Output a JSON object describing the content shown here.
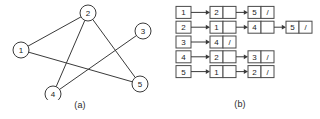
{
  "figure": {
    "panel_a": {
      "caption": "(a)",
      "nodes": [
        {
          "id": "1",
          "label": "1",
          "x": 21,
          "y": 50
        },
        {
          "id": "2",
          "label": "2",
          "x": 88,
          "y": 13
        },
        {
          "id": "3",
          "label": "3",
          "x": 143,
          "y": 31
        },
        {
          "id": "4",
          "label": "4",
          "x": 53,
          "y": 94
        },
        {
          "id": "5",
          "label": "5",
          "x": 140,
          "y": 84
        }
      ],
      "edges": [
        {
          "from": "1",
          "to": "2"
        },
        {
          "from": "1",
          "to": "5"
        },
        {
          "from": "2",
          "to": "4"
        },
        {
          "from": "2",
          "to": "5"
        },
        {
          "from": "3",
          "to": "4"
        }
      ],
      "node_radius": 8
    },
    "panel_b": {
      "caption": "(b)",
      "null_symbol": "/",
      "rows": [
        {
          "index": "1",
          "cells": [
            "2",
            "5"
          ]
        },
        {
          "index": "2",
          "cells": [
            "1",
            "4",
            "5"
          ]
        },
        {
          "index": "3",
          "cells": [
            "4"
          ]
        },
        {
          "index": "4",
          "cells": [
            "2",
            "3"
          ]
        },
        {
          "index": "5",
          "cells": [
            "1",
            "2"
          ]
        }
      ]
    }
  },
  "style": {
    "stroke": "#3a3a3a",
    "box_stroke": "#4a4a4a",
    "background": "#ffffff",
    "text": "#1c1c1c"
  }
}
